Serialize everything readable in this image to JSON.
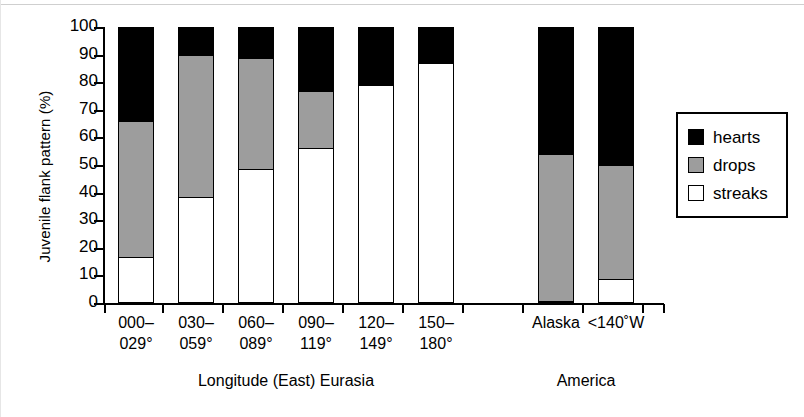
{
  "figure": {
    "y_axis_title": "Juvenile flank pattern (%)",
    "group_labels": [
      {
        "text": "Longitude (East) Eurasia"
      },
      {
        "text": "America"
      }
    ]
  },
  "legend": {
    "entries": [
      {
        "label": "hearts",
        "color": "#000000",
        "key": "hearts"
      },
      {
        "label": "drops",
        "color": "#9d9d9d",
        "key": "drops"
      },
      {
        "label": "streaks",
        "color": "#ffffff",
        "key": "streaks"
      }
    ]
  },
  "chart_data": {
    "type": "bar",
    "subtype": "stacked-100-percent",
    "title": "",
    "xlabel": "Longitude (East) Eurasia / America",
    "ylabel": "Juvenile flank pattern (%)",
    "ylim": [
      0,
      100
    ],
    "yticks": [
      0,
      10,
      20,
      30,
      40,
      50,
      60,
      70,
      80,
      90,
      100
    ],
    "ytick_labels": [
      "0",
      "10",
      "20",
      "30",
      "40",
      "50",
      "60",
      "70",
      "80",
      "90",
      "100"
    ],
    "grid": false,
    "legend_position": "right",
    "categories": [
      "000–\n029°",
      "030–\n059°",
      "060–\n089°",
      "090–\n119°",
      "120–\n149°",
      "150–\n180°",
      "Alaska",
      "<140˚W"
    ],
    "groups": [
      {
        "name": "Longitude (East) Eurasia",
        "categories": [
          "000–\n029°",
          "030–\n059°",
          "060–\n089°",
          "090–\n119°",
          "120–\n149°",
          "150–\n180°"
        ]
      },
      {
        "name": "America",
        "categories": [
          "Alaska",
          "<140˚W"
        ]
      }
    ],
    "series": [
      {
        "name": "streaks",
        "color": "#ffffff",
        "values": [
          16,
          38,
          48,
          56,
          79,
          87,
          0,
          8
        ]
      },
      {
        "name": "drops",
        "color": "#9d9d9d",
        "values": [
          50,
          52,
          41,
          21,
          0,
          0,
          54,
          42
        ]
      },
      {
        "name": "hearts",
        "color": "#000000",
        "values": [
          34,
          10,
          11,
          23,
          21,
          13,
          46,
          50
        ]
      }
    ],
    "cumulative_tops": {
      "streaks": [
        16,
        38,
        48,
        56,
        79,
        87,
        0,
        8
      ],
      "drops": [
        66,
        90,
        89,
        77,
        79,
        87,
        54,
        50
      ],
      "hearts": [
        100,
        100,
        100,
        100,
        100,
        100,
        100,
        100
      ]
    }
  }
}
